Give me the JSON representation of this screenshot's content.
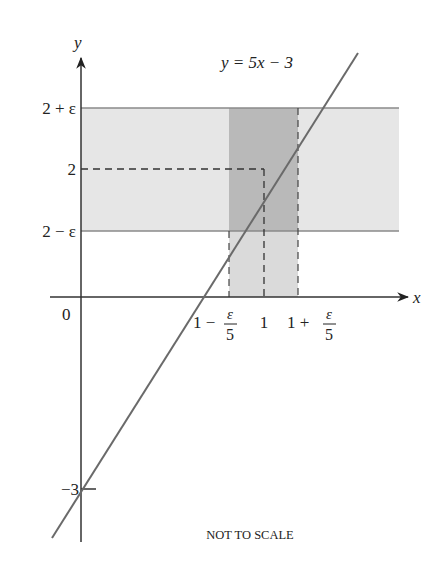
{
  "figure": {
    "equation_label": "y = 5x − 3",
    "note": "NOT TO SCALE",
    "axes": {
      "x_label": "x",
      "y_label": "y",
      "origin_label": "0"
    },
    "y_ticks": [
      {
        "label": "2 + ε",
        "value": "2+eps"
      },
      {
        "label": "2",
        "value": "2"
      },
      {
        "label": "2 − ε",
        "value": "2-eps"
      },
      {
        "label": "−3",
        "value": "-3"
      }
    ],
    "x_ticks": [
      {
        "label_top": "1 −",
        "frac_num": "ε",
        "frac_den": "5",
        "value": "1-eps/5"
      },
      {
        "label_top": "1",
        "value": "1"
      },
      {
        "label_top": "1 +",
        "frac_num": "ε",
        "frac_den": "5",
        "value": "1+eps/5"
      }
    ],
    "colors": {
      "horizontal_band": "#e6e6e6",
      "vertical_band": "#d9d9d9",
      "overlap": "#b8b8b8",
      "line": "#666666",
      "axes": "#333333"
    }
  }
}
